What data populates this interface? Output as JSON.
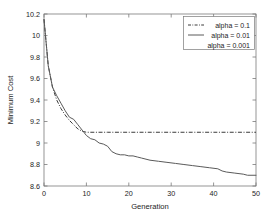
{
  "chart_data": {
    "type": "line",
    "title": "",
    "xlabel": "Generation",
    "ylabel": "Minimum Cost",
    "xlim": [
      0,
      50
    ],
    "ylim": [
      8.6,
      10.2
    ],
    "xticks": [
      0,
      10,
      20,
      30,
      40,
      50
    ],
    "xtick_labels": [
      "0",
      "10",
      "20",
      "30",
      "40",
      "50"
    ],
    "yticks": [
      8.6,
      8.8,
      9.0,
      9.2,
      9.4,
      9.6,
      9.8,
      10.0,
      10.2
    ],
    "ytick_labels": [
      "8.6",
      "8.8",
      "9",
      "9.2",
      "9.4",
      "9.6",
      "9.8",
      "10",
      "10.2"
    ],
    "grid": false,
    "legend_position": "upper right",
    "series": [
      {
        "name": "alpha = 0.1",
        "style": "dash-dot",
        "color": "#3a3a3a",
        "x": [
          0,
          1,
          2,
          3,
          4,
          5,
          6,
          7,
          8,
          9,
          10,
          12,
          15,
          20,
          25,
          30,
          35,
          40,
          45,
          50
        ],
        "values": [
          10.15,
          9.72,
          9.52,
          9.4,
          9.32,
          9.26,
          9.21,
          9.17,
          9.13,
          9.11,
          9.1,
          9.1,
          9.1,
          9.1,
          9.1,
          9.1,
          9.1,
          9.1,
          9.1,
          9.1
        ]
      },
      {
        "name": "alpha = 0.01",
        "style": "solid",
        "color": "#5a5a5a",
        "x": [
          0,
          1,
          2,
          3,
          4,
          5,
          6,
          7,
          8,
          9,
          10,
          11,
          12,
          13,
          14,
          15,
          16,
          17,
          18,
          19,
          20,
          21,
          22,
          23,
          25,
          27,
          29,
          31,
          33,
          35,
          37,
          39,
          41,
          42,
          43,
          45,
          47,
          48,
          50
        ],
        "values": [
          10.15,
          9.72,
          9.52,
          9.44,
          9.37,
          9.3,
          9.24,
          9.22,
          9.17,
          9.12,
          9.07,
          9.04,
          9.03,
          9.0,
          8.99,
          8.97,
          8.92,
          8.9,
          8.89,
          8.89,
          8.88,
          8.88,
          8.87,
          8.86,
          8.84,
          8.83,
          8.82,
          8.81,
          8.8,
          8.79,
          8.78,
          8.77,
          8.76,
          8.74,
          8.73,
          8.72,
          8.71,
          8.7,
          8.7
        ]
      },
      {
        "name": "alpha = 0.001",
        "style": "none",
        "color": "#5a5a5a",
        "x": [],
        "values": []
      }
    ]
  },
  "legend": {
    "entries": [
      {
        "label": "alpha = 0.1",
        "style": "dash-dot"
      },
      {
        "label": "alpha = 0.01",
        "style": "solid"
      },
      {
        "label": "alpha = 0.001",
        "style": "none"
      }
    ]
  },
  "axes": {
    "x_title": "Generation",
    "y_title": "Minimum Cost"
  }
}
